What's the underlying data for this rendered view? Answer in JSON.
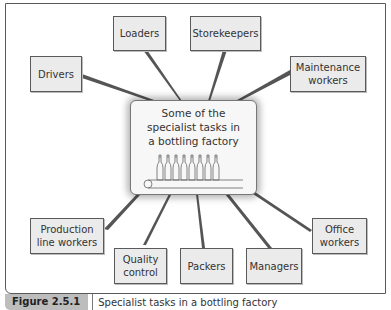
{
  "diagram": {
    "center": {
      "lines": [
        "Some of the",
        "specialist tasks in",
        "a bottling factory"
      ],
      "illustration": "bottles-on-conveyor-icon"
    },
    "nodes": [
      {
        "id": "loaders",
        "label": "Loaders"
      },
      {
        "id": "storekeepers",
        "label": "Storekeepers"
      },
      {
        "id": "drivers",
        "label": "Drivers"
      },
      {
        "id": "maintenance",
        "line1": "Maintenance",
        "line2": "workers"
      },
      {
        "id": "production",
        "line1": "Production",
        "line2": "line workers"
      },
      {
        "id": "quality",
        "line1": "Quality",
        "line2": "control"
      },
      {
        "id": "packers",
        "label": "Packers"
      },
      {
        "id": "managers",
        "label": "Managers"
      },
      {
        "id": "office",
        "line1": "Office",
        "line2": "workers"
      }
    ]
  },
  "caption": {
    "label": "Figure 2.5.1",
    "text": "Specialist tasks in a bottling factory"
  },
  "colors": {
    "box_fill": "#ebebeb",
    "border": "#5a5a5a",
    "caption_label_bg": "#bdbdbd"
  }
}
